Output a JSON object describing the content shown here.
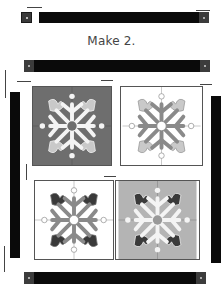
{
  "instruction": {
    "label": "Make 2."
  },
  "colors": {
    "strip": "#0a0a0a",
    "strip_end_square": "#3a3a3a",
    "block_dark_bg": "#6e6e6e",
    "block_light_bg": "#ffffff",
    "block_gray_bg": "#b4b4b4",
    "motif_white": "#f4f4f4",
    "motif_gray": "#8a8a8a",
    "petal_light": "#c9c9c9",
    "petal_dark": "#3a3a3a"
  },
  "strips": [
    {
      "id": "top-strip",
      "orientation": "horizontal"
    },
    {
      "id": "upper-strip",
      "orientation": "horizontal"
    },
    {
      "id": "left-strip",
      "orientation": "vertical"
    },
    {
      "id": "right-strip",
      "orientation": "vertical"
    },
    {
      "id": "bottom-strip",
      "orientation": "horizontal"
    }
  ],
  "blocks": [
    {
      "id": "block-top-left",
      "background": "dark",
      "motif": "white snowflake, light petals"
    },
    {
      "id": "block-top-right",
      "background": "white",
      "motif": "gray snowflake, light petals"
    },
    {
      "id": "block-bottom-left",
      "background": "white",
      "motif": "gray snowflake, dark petals"
    },
    {
      "id": "block-bottom-right",
      "background": "light gray",
      "motif": "white snowflake, dark petals"
    }
  ]
}
